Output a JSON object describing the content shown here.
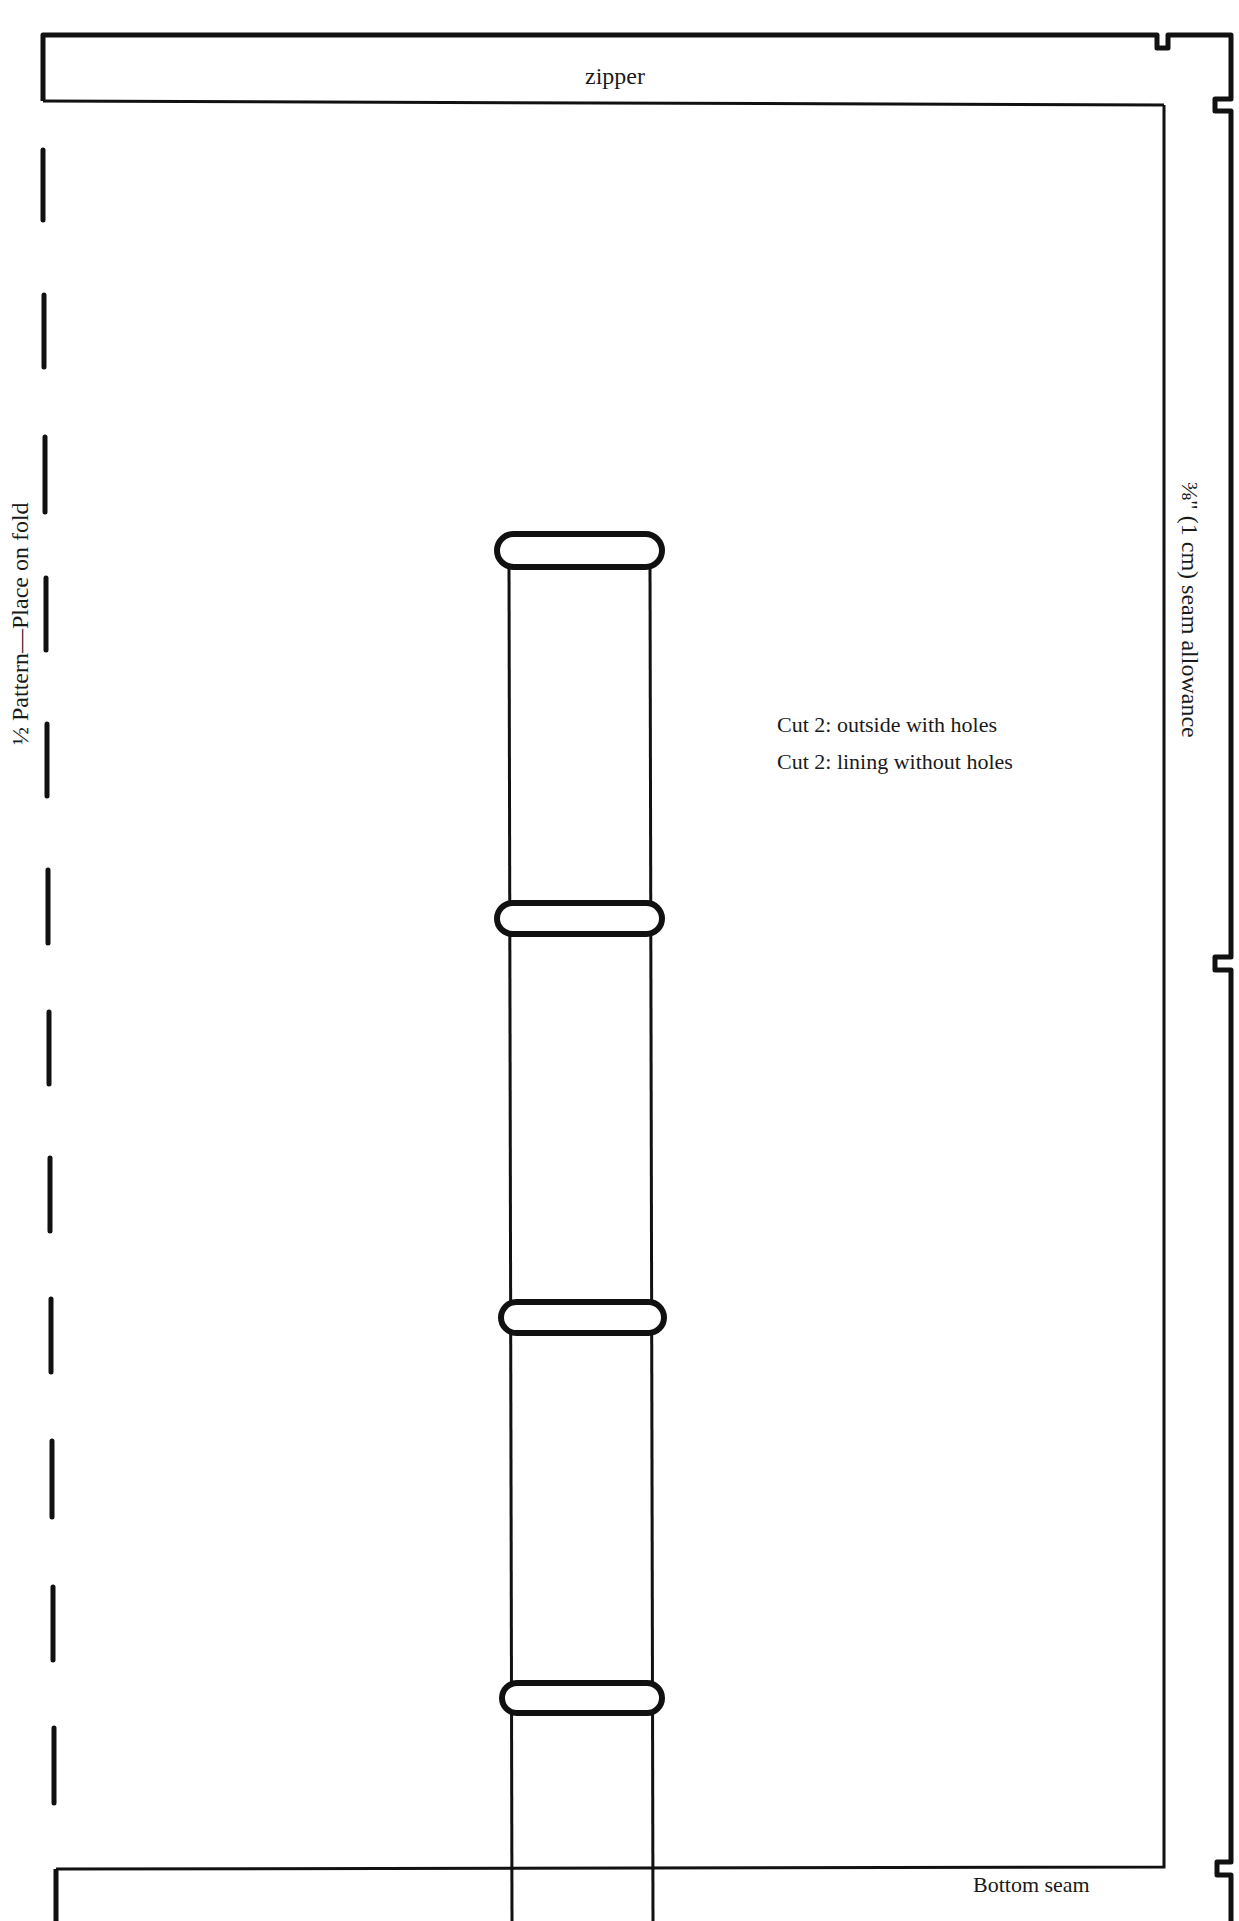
{
  "pattern": {
    "labels": {
      "top_band": "zipper",
      "fold_edge": "½ Pattern—Place on fold",
      "seam_allowance": "⅜\" (1 cm) seam allowance",
      "bottom_edge": "Bottom seam"
    },
    "cutting_instructions": [
      "Cut 2: outside with holes",
      "Cut 2: lining without holes"
    ],
    "elements": {
      "strap_holes_count": 4,
      "fold_line_style": "dashed",
      "notches": [
        "top-edge notch",
        "right-edge notch top",
        "right-edge notch middle",
        "right-edge notch bottom"
      ]
    },
    "colors": {
      "line": "#111111",
      "background": "#ffffff",
      "text": "#1a1a1a"
    }
  }
}
